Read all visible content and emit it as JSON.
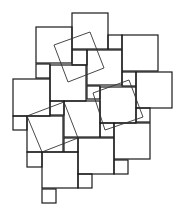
{
  "diagram": {
    "type": "pythagorean-tiling",
    "width": 182,
    "height": 216,
    "colors": {
      "background": "#ffffff",
      "stroke": "#1a1a1a",
      "rotated_stroke": "#333333"
    },
    "large_squares": [
      {
        "x": 72,
        "y": 13,
        "size": 36
      },
      {
        "x": 36,
        "y": 27,
        "size": 36
      },
      {
        "x": 122,
        "y": 35,
        "size": 36
      },
      {
        "x": 87,
        "y": 50,
        "size": 35
      },
      {
        "x": 50,
        "y": 65,
        "size": 36
      },
      {
        "x": 136,
        "y": 72,
        "size": 36
      },
      {
        "x": 13,
        "y": 79,
        "size": 37
      },
      {
        "x": 100,
        "y": 87,
        "size": 36
      },
      {
        "x": 64,
        "y": 101,
        "size": 36
      },
      {
        "x": 27,
        "y": 116,
        "size": 36
      },
      {
        "x": 114,
        "y": 123,
        "size": 36
      },
      {
        "x": 78,
        "y": 138,
        "size": 36
      },
      {
        "x": 42,
        "y": 152,
        "size": 36
      }
    ],
    "small_squares": [
      {
        "x": 72,
        "y": 50,
        "size": 15
      },
      {
        "x": 36,
        "y": 64,
        "size": 14
      },
      {
        "x": 108,
        "y": 35,
        "size": 14
      },
      {
        "x": 122,
        "y": 72,
        "size": 14
      },
      {
        "x": 87,
        "y": 86,
        "size": 13
      },
      {
        "x": 50,
        "y": 101,
        "size": 14
      },
      {
        "x": 136,
        "y": 108,
        "size": 14
      },
      {
        "x": 13,
        "y": 116,
        "size": 14
      },
      {
        "x": 100,
        "y": 123,
        "size": 14
      },
      {
        "x": 64,
        "y": 138,
        "size": 14
      },
      {
        "x": 27,
        "y": 152,
        "size": 15
      },
      {
        "x": 114,
        "y": 160,
        "size": 14
      },
      {
        "x": 78,
        "y": 174,
        "size": 14
      },
      {
        "x": 42,
        "y": 189,
        "size": 14
      }
    ],
    "rotated_squares": [
      {
        "points": "54,45 90,32 104,68 68,82"
      },
      {
        "points": "93,93 129,80 143,117 105,130"
      },
      {
        "points": "27,116 64,102 78,138 42,152"
      }
    ]
  }
}
